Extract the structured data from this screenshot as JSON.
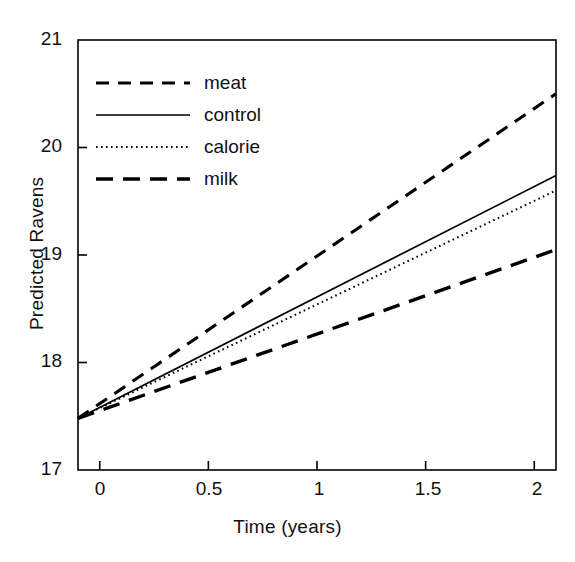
{
  "chart_data": {
    "type": "line",
    "title": "",
    "xlabel": "Time (years)",
    "ylabel": "Predicted Ravens",
    "xlim": [
      -0.1,
      2.1
    ],
    "ylim": [
      17,
      21
    ],
    "xticks": [
      "0",
      "0.5",
      "1",
      "1.5",
      "2"
    ],
    "xtick_values": [
      0,
      0.5,
      1,
      1.5,
      2
    ],
    "yticks": [
      "17",
      "18",
      "19",
      "20",
      "21"
    ],
    "ytick_values": [
      17,
      18,
      19,
      20,
      21
    ],
    "grid": false,
    "legend_position": "top-left",
    "x": [
      -0.1,
      2.1
    ],
    "series": [
      {
        "name": "meat",
        "style": "dashed",
        "color": "#000000",
        "values": [
          17.48,
          20.5
        ],
        "slope": 1.373,
        "intercept": 17.617
      },
      {
        "name": "control",
        "style": "solid",
        "color": "#000000",
        "values": [
          17.48,
          19.74
        ],
        "slope": 1.027,
        "intercept": 17.583
      },
      {
        "name": "calorie",
        "style": "dotted",
        "color": "#000000",
        "values": [
          17.48,
          19.6
        ],
        "slope": 0.964,
        "intercept": 17.576
      },
      {
        "name": "milk",
        "style": "dashed-long",
        "color": "#000000",
        "values": [
          17.48,
          19.05
        ],
        "slope": 0.714,
        "intercept": 17.551
      }
    ]
  },
  "legend": {
    "items": [
      {
        "label": "meat",
        "style": "dashed"
      },
      {
        "label": "control",
        "style": "solid"
      },
      {
        "label": "calorie",
        "style": "dotted"
      },
      {
        "label": "milk",
        "style": "dashed-long"
      }
    ]
  },
  "axes": {
    "x_title": "Time (years)",
    "y_title": "Predicted Ravens"
  }
}
